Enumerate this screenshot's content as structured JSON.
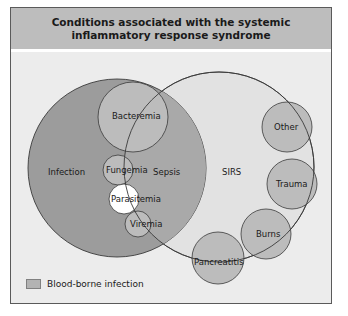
{
  "title": "Conditions associated with the systemic inflammatory response syndrome",
  "colors": {
    "header_bg": "#bdbdbd",
    "body_bg": "#ececec",
    "infection_fill": "#9c9c9c",
    "sirs_fill": "#e2e2e2",
    "blood_borne_fill": "#bcbcbc",
    "parasitemia_fill": "#ffffff",
    "outline": "#3a3a3a"
  },
  "sets": {
    "infection": "Infection",
    "sepsis": "Sepsis",
    "sirs": "SIRS"
  },
  "conditions": {
    "bacteremia": "Bacteremia",
    "fungemia": "Fungemia",
    "parasitemia": "Parasitemia",
    "viremia": "Viremia",
    "other": "Other",
    "trauma": "Trauma",
    "burns": "Burns",
    "pancreatitis": "Pancreatitis"
  },
  "legend": {
    "items": [
      {
        "label": "Blood-borne infection",
        "color": "#bcbcbc"
      }
    ]
  }
}
